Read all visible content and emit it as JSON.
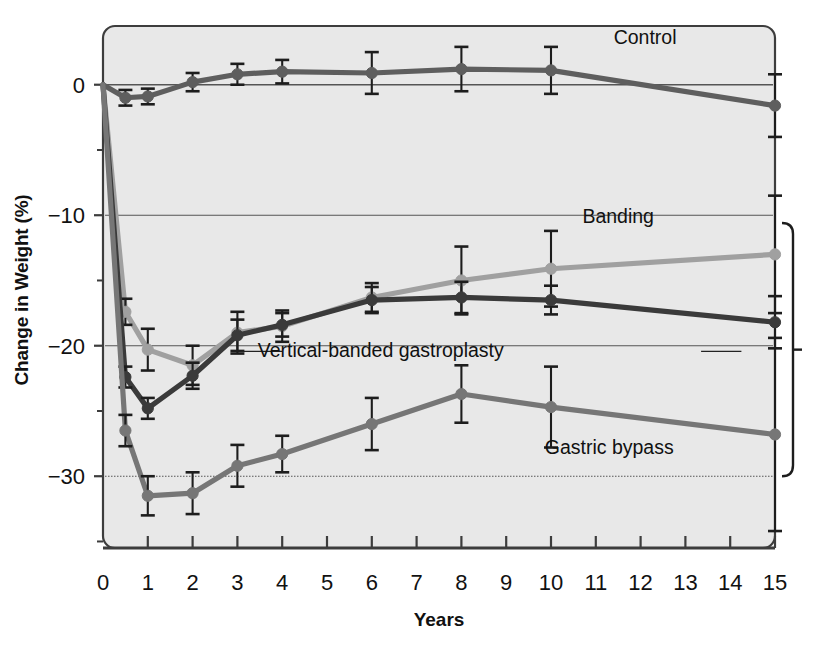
{
  "chart_data": {
    "type": "line",
    "title": "",
    "xlabel": "Years",
    "ylabel": "Change in Weight (%)",
    "xlim": [
      0,
      15
    ],
    "ylim": [
      -35.5,
      4.5
    ],
    "xticks": [
      "0",
      "1",
      "2",
      "3",
      "4",
      "5",
      "6",
      "7",
      "8",
      "9",
      "10",
      "11",
      "12",
      "13",
      "14",
      "15"
    ],
    "yticks": [
      "0",
      "-10",
      "-20",
      "-30"
    ],
    "ytick_values": [
      0,
      -10,
      -20,
      -30
    ],
    "yminor_values": [
      -5,
      -15,
      -25,
      -35
    ],
    "grid": "horizontal-major",
    "legend": "inline-annotations",
    "x": [
      0,
      0.5,
      1,
      2,
      3,
      4,
      6,
      8,
      10,
      15
    ],
    "series": [
      {
        "name": "Control",
        "color": "#5e5e5e",
        "values": [
          0,
          -1.0,
          -0.9,
          0.2,
          0.8,
          1.0,
          0.9,
          1.2,
          1.1,
          -1.6
        ],
        "errors": [
          0,
          0.6,
          0.6,
          0.7,
          0.8,
          0.9,
          1.6,
          1.7,
          1.8,
          2.4
        ],
        "label_x": 12.1,
        "label_y": 3.1
      },
      {
        "name": "Banding",
        "color": "#a0a0a0",
        "values": [
          0,
          -17.4,
          -20.3,
          -21.5,
          -19.0,
          -18.5,
          -16.3,
          -15.0,
          -14.1,
          -13.0
        ],
        "errors": [
          0,
          1.0,
          1.6,
          1.5,
          1.6,
          1.2,
          1.1,
          2.6,
          2.9,
          4.5
        ],
        "label_x": 11.5,
        "label_y": -10.6
      },
      {
        "name": "Vertical-banded gastroplasty",
        "color": "#3a3a3a",
        "values": [
          0,
          -22.4,
          -24.8,
          -22.3,
          -19.2,
          -18.4,
          -16.5,
          -16.3,
          -16.5,
          -18.2
        ],
        "errors": [
          0,
          0.8,
          0.8,
          1.0,
          1.2,
          0.9,
          1.0,
          1.2,
          1.1,
          2.0
        ],
        "label_x": 6.2,
        "label_y": -20.9
      },
      {
        "name": "Gastric bypass",
        "color": "#767676",
        "values": [
          0,
          -26.5,
          -31.5,
          -31.3,
          -29.2,
          -28.3,
          -26.0,
          -23.7,
          -24.7,
          -26.8
        ],
        "errors": [
          0,
          1.2,
          1.5,
          1.6,
          1.6,
          1.4,
          2.0,
          2.2,
          3.1,
          7.4
        ],
        "label_x": 11.3,
        "label_y": -28.3
      }
    ],
    "annotations": [
      {
        "name": "right-bracket",
        "from": -10.6,
        "to": -30.0,
        "note": ""
      }
    ]
  },
  "axis": {
    "ylabel": "Change in Weight (%)",
    "xlabel": "Years"
  },
  "style": {
    "plot_background": "#e8e8e8",
    "plot_border": "#3d3d3d",
    "gridline": "#555555"
  }
}
